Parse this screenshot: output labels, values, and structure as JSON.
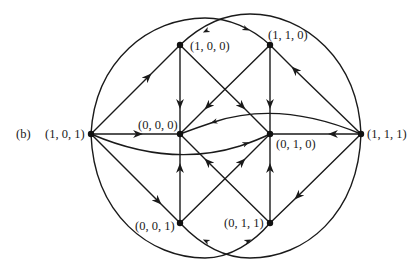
{
  "figure_label": "(b)",
  "colors": {
    "stroke": "#1a1a1a",
    "node": "#111111",
    "background": "#ffffff"
  },
  "nodes": [
    {
      "id": "101",
      "label": "(1, 0, 1)",
      "x": 91,
      "y": 134
    },
    {
      "id": "100",
      "label": "(1, 0, 0)",
      "x": 180,
      "y": 45
    },
    {
      "id": "110",
      "label": "(1, 1, 0)",
      "x": 270,
      "y": 45
    },
    {
      "id": "000",
      "label": "(0, 0, 0)",
      "x": 180,
      "y": 134
    },
    {
      "id": "010",
      "label": "(0, 1, 0)",
      "x": 270,
      "y": 134
    },
    {
      "id": "111",
      "label": "(1, 1, 1)",
      "x": 361,
      "y": 134
    },
    {
      "id": "001",
      "label": "(0, 0, 1)",
      "x": 180,
      "y": 223
    },
    {
      "id": "011",
      "label": "(0, 1, 1)",
      "x": 270,
      "y": 223
    }
  ],
  "edges": [
    {
      "from": "(1, 0, 1)",
      "to": "(1, 0, 0)"
    },
    {
      "from": "(1, 0, 1)",
      "to": "(0, 0, 0)"
    },
    {
      "from": "(1, 0, 1)",
      "to": "(0, 0, 1)"
    },
    {
      "from": "(1, 0, 1)",
      "to": "(0, 1, 0)",
      "curved": true
    },
    {
      "from": "(1, 0, 1)",
      "to": "(1, 1, 0)",
      "curved": true
    },
    {
      "from": "(1, 0, 1)",
      "to": "(0, 1, 1)",
      "curved": true
    },
    {
      "from": "(1, 1, 1)",
      "to": "(1, 1, 0)"
    },
    {
      "from": "(1, 1, 1)",
      "to": "(0, 1, 0)"
    },
    {
      "from": "(1, 1, 1)",
      "to": "(0, 1, 1)"
    },
    {
      "from": "(1, 1, 1)",
      "to": "(0, 0, 0)",
      "curved": true
    },
    {
      "from": "(1, 1, 1)",
      "to": "(1, 0, 0)",
      "curved": true
    },
    {
      "from": "(1, 1, 1)",
      "to": "(0, 0, 1)",
      "curved": true
    },
    {
      "from": "(1, 0, 0)",
      "to": "(0, 0, 0)"
    },
    {
      "from": "(1, 0, 0)",
      "to": "(0, 1, 0)"
    },
    {
      "from": "(1, 1, 0)",
      "to": "(0, 1, 0)"
    },
    {
      "from": "(1, 1, 0)",
      "to": "(0, 0, 0)"
    },
    {
      "from": "(0, 0, 1)",
      "to": "(0, 0, 0)"
    },
    {
      "from": "(0, 0, 1)",
      "to": "(0, 1, 0)"
    },
    {
      "from": "(0, 1, 1)",
      "to": "(0, 1, 0)"
    },
    {
      "from": "(0, 1, 1)",
      "to": "(0, 0, 0)"
    }
  ]
}
